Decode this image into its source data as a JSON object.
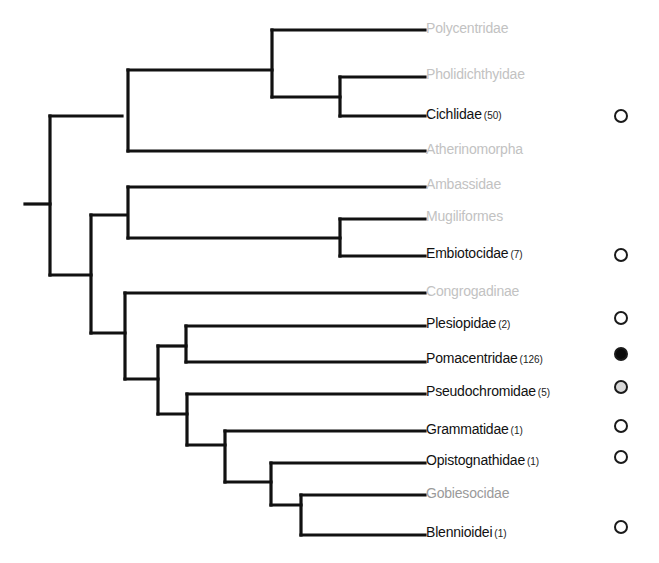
{
  "diagram": {
    "type": "phylogenetic-tree",
    "line_color": "#111111",
    "colors": {
      "highlighted_label": "#111111",
      "dim_label": "#c2c2c2",
      "marker_filled": "#0a0a0a",
      "marker_partial": "#d8d8d8",
      "marker_empty": "#ffffff"
    },
    "taxa": [
      {
        "name": "Polycentridae",
        "count": "",
        "highlighted": false,
        "marker": "none"
      },
      {
        "name": "Pholidichthyidae",
        "count": "",
        "highlighted": false,
        "marker": "none"
      },
      {
        "name": "Cichlidae",
        "count": "(50)",
        "highlighted": true,
        "marker": "empty"
      },
      {
        "name": "Atherinomorpha",
        "count": "",
        "highlighted": false,
        "marker": "none"
      },
      {
        "name": "Ambassidae",
        "count": "",
        "highlighted": false,
        "marker": "none"
      },
      {
        "name": "Mugiliformes",
        "count": "",
        "highlighted": false,
        "marker": "none"
      },
      {
        "name": "Embiotocidae",
        "count": "(7)",
        "highlighted": true,
        "marker": "empty"
      },
      {
        "name": "Congrogadinae",
        "count": "",
        "highlighted": false,
        "marker": "none"
      },
      {
        "name": "Plesiopidae",
        "count": "(2)",
        "highlighted": true,
        "marker": "empty"
      },
      {
        "name": "Pomacentridae",
        "count": "(126)",
        "highlighted": true,
        "marker": "filled"
      },
      {
        "name": "Pseudochromidae",
        "count": "(5)",
        "highlighted": true,
        "marker": "partial"
      },
      {
        "name": "Grammatidae",
        "count": "(1)",
        "highlighted": true,
        "marker": "empty"
      },
      {
        "name": "Opistognathidae",
        "count": "(1)",
        "highlighted": true,
        "marker": "empty"
      },
      {
        "name": "Gobiesocidae",
        "count": "",
        "highlighted": false,
        "marker": "none"
      },
      {
        "name": "Blennioidei",
        "count": "(1)",
        "highlighted": true,
        "marker": "empty"
      }
    ]
  }
}
